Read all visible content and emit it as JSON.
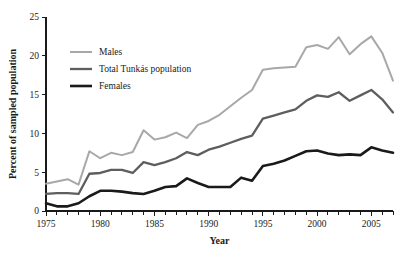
{
  "figure": {
    "caption_sliver": "",
    "background_color": "#ffffff"
  },
  "chart_data": {
    "type": "line",
    "title": "",
    "xlabel": "Year",
    "ylabel": "Percent of sampled population",
    "xlim": [
      1975,
      2007
    ],
    "ylim": [
      0,
      25
    ],
    "ytick_values": [
      0,
      5,
      10,
      15,
      20,
      25
    ],
    "ytick_labels": [
      "0",
      "5",
      "10",
      "15",
      "20",
      "25"
    ],
    "xtick_values": [
      1975,
      1980,
      1985,
      1990,
      1995,
      2000,
      2005
    ],
    "xtick_labels": [
      "1975",
      "1980",
      "1985",
      "1990",
      "1995",
      "2000",
      "2005"
    ],
    "xtick_minor_step": 1,
    "grid": false,
    "legend_position": "upper-left-inside",
    "x": [
      1975,
      1976,
      1977,
      1978,
      1979,
      1980,
      1981,
      1982,
      1983,
      1984,
      1985,
      1986,
      1987,
      1988,
      1989,
      1990,
      1991,
      1992,
      1993,
      1994,
      1995,
      1996,
      1997,
      1998,
      1999,
      2000,
      2001,
      2002,
      2003,
      2004,
      2005,
      2006,
      2007
    ],
    "series": [
      {
        "name": "Males",
        "color": "#a8a8a8",
        "width": 2.0,
        "values": [
          3.5,
          3.8,
          4.1,
          3.4,
          7.7,
          6.8,
          7.5,
          7.2,
          7.6,
          10.4,
          9.2,
          9.5,
          10.1,
          9.4,
          11.1,
          11.6,
          12.4,
          13.5,
          14.6,
          15.6,
          18.2,
          18.4,
          18.5,
          18.6,
          21.1,
          21.4,
          20.9,
          22.4,
          20.2,
          21.5,
          22.5,
          20.4,
          16.8
        ]
      },
      {
        "name": "Total Tunkás population",
        "color": "#5e5e5e",
        "width": 2.3,
        "values": [
          2.2,
          2.3,
          2.3,
          2.2,
          4.8,
          4.9,
          5.3,
          5.3,
          4.9,
          6.3,
          5.9,
          6.3,
          6.8,
          7.6,
          7.2,
          7.9,
          8.3,
          8.8,
          9.3,
          9.7,
          11.9,
          12.3,
          12.7,
          13.1,
          14.2,
          14.9,
          14.7,
          15.3,
          14.2,
          14.9,
          15.6,
          14.4,
          12.7
        ]
      },
      {
        "name": "Females",
        "color": "#1a1a1a",
        "width": 2.6,
        "values": [
          1.0,
          0.6,
          0.6,
          1.0,
          1.9,
          2.6,
          2.6,
          2.5,
          2.3,
          2.2,
          2.6,
          3.1,
          3.2,
          4.2,
          3.6,
          3.1,
          3.1,
          3.1,
          4.3,
          3.9,
          5.8,
          6.1,
          6.5,
          7.1,
          7.7,
          7.8,
          7.4,
          7.2,
          7.3,
          7.2,
          8.2,
          7.8,
          7.5
        ]
      }
    ]
  }
}
